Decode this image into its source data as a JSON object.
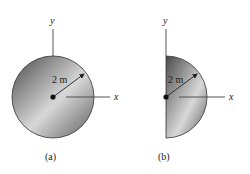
{
  "figures": [
    {
      "id": "a",
      "caption": "(a)",
      "shape": "full-circle",
      "radius_label": "2 m",
      "axis_x_label": "x",
      "axis_y_label": "y"
    },
    {
      "id": "b",
      "caption": "(b)",
      "shape": "semicircle",
      "radius_label": "2 m",
      "axis_x_label": "x",
      "axis_y_label": "y"
    }
  ],
  "colors": {
    "fill_dark": "#5a5a5a",
    "fill_light": "#d6d6d6",
    "stroke": "#333333"
  }
}
